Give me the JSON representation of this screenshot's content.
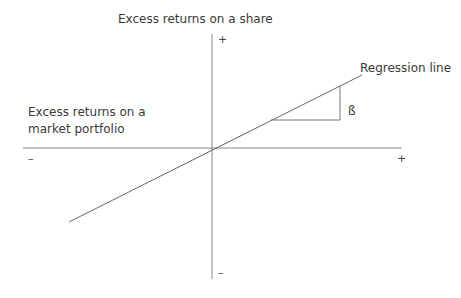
{
  "diagram": {
    "title_y": "Excess returns on a share",
    "title_x_line1": "Excess returns on a",
    "title_x_line2": "market portfolio",
    "regression_label": "Regression line",
    "beta_label": "ß",
    "y_plus": "+",
    "y_minus": "–",
    "x_plus": "+",
    "x_minus": "–",
    "colors": {
      "axis": "#8a8a8a",
      "line": "#666666",
      "text": "#3a3a3a"
    }
  }
}
